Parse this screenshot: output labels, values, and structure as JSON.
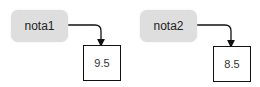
{
  "diagram": {
    "variables": [
      {
        "name": "nota1",
        "value": "9.5"
      },
      {
        "name": "nota2",
        "value": "8.5"
      }
    ],
    "colors": {
      "variable_box": "#dedede",
      "value_border": "#111111",
      "arrow": "#111111"
    }
  }
}
